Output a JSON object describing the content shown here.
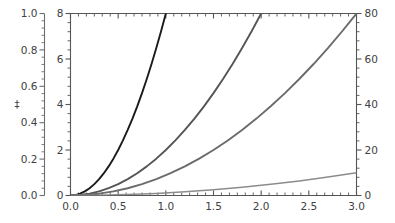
{
  "figure": {
    "background_color": "#ffffff",
    "axis_color": "#555555",
    "text_color": "#414141",
    "title": "",
    "faint_marker": "‡"
  },
  "chart_data": {
    "type": "line",
    "title": "",
    "xlabel": "",
    "ylabel": "",
    "grid": false,
    "legend": "none",
    "xlim": [
      0.0,
      3.0
    ],
    "x_ticks": [
      "0.0",
      "0.5",
      "1.0",
      "1.5",
      "2.0",
      "2.5",
      "3.0"
    ],
    "x_tick_values": [
      0.0,
      0.5,
      1.0,
      1.5,
      2.0,
      2.5,
      3.0
    ],
    "x_minor_per_interval": 5,
    "axes": [
      {
        "id": "outer-left",
        "position": "left-detached",
        "ylim": [
          0.0,
          1.0
        ],
        "ticks": [
          "0.0",
          "0.2",
          "0.4",
          "0.6",
          "0.8",
          "1.0"
        ],
        "tick_values": [
          0.0,
          0.2,
          0.4,
          0.6,
          0.8,
          1.0
        ],
        "minor_per_interval": 4,
        "color": "#6e6e6e"
      },
      {
        "id": "inner-left",
        "position": "left",
        "ylim": [
          0,
          8
        ],
        "ticks": [
          "0",
          "2",
          "4",
          "6",
          "8"
        ],
        "tick_values": [
          0,
          2,
          4,
          6,
          8
        ],
        "minor_per_interval": 4,
        "color": "#555555"
      },
      {
        "id": "right",
        "position": "right",
        "ylim": [
          0,
          80
        ],
        "ticks": [
          "0",
          "20",
          "40",
          "60",
          "80"
        ],
        "tick_values": [
          0,
          20,
          40,
          60,
          80
        ],
        "minor_per_interval": 4,
        "color": "#555555"
      }
    ],
    "series": [
      {
        "name": "curve-1",
        "color": "#1a1a1a",
        "width": 1.9,
        "axis": "inner-left",
        "x": [
          0.0,
          0.05,
          0.1,
          0.15,
          0.2,
          0.25,
          0.3,
          0.35,
          0.4,
          0.45,
          0.5,
          0.55,
          0.6,
          0.65,
          0.7,
          0.75,
          0.8,
          0.85,
          0.9,
          0.95,
          1.0
        ],
        "y": [
          0.0,
          0.02,
          0.08,
          0.18,
          0.32,
          0.5,
          0.72,
          0.98,
          1.28,
          1.62,
          2.0,
          2.42,
          2.88,
          3.38,
          3.92,
          4.5,
          5.12,
          5.78,
          6.48,
          7.22,
          8.0
        ]
      },
      {
        "name": "curve-2",
        "color": "#555555",
        "width": 1.9,
        "axis": "inner-left",
        "x": [
          0.0,
          0.1,
          0.2,
          0.3,
          0.4,
          0.5,
          0.6,
          0.7,
          0.8,
          0.9,
          1.0,
          1.1,
          1.2,
          1.3,
          1.4,
          1.5,
          1.6,
          1.7,
          1.8,
          1.9,
          2.0
        ],
        "y": [
          0.0,
          0.02,
          0.08,
          0.18,
          0.32,
          0.5,
          0.72,
          0.98,
          1.28,
          1.62,
          2.0,
          2.42,
          2.88,
          3.38,
          3.92,
          4.5,
          5.12,
          5.78,
          6.48,
          7.22,
          8.0
        ]
      },
      {
        "name": "curve-3",
        "color": "#6b6b6b",
        "width": 1.9,
        "axis": "right",
        "x": [
          0.0,
          0.15,
          0.3,
          0.45,
          0.6,
          0.75,
          0.9,
          1.05,
          1.2,
          1.35,
          1.5,
          1.65,
          1.8,
          1.95,
          2.1,
          2.25,
          2.4,
          2.55,
          2.7,
          2.85,
          3.0
        ],
        "y": [
          0.0,
          0.2,
          0.8,
          1.8,
          3.2,
          5.0,
          7.2,
          9.8,
          12.8,
          16.2,
          20.0,
          24.2,
          28.8,
          33.8,
          39.2,
          45.0,
          51.2,
          57.8,
          64.8,
          72.2,
          80.0
        ]
      },
      {
        "name": "curve-4-flat",
        "color": "#8c8c8c",
        "width": 1.5,
        "axis": "inner-left",
        "x": [
          0.0,
          0.3,
          0.6,
          0.9,
          1.2,
          1.5,
          1.8,
          2.1,
          2.4,
          2.7,
          3.0
        ],
        "y": [
          0.0,
          0.01,
          0.04,
          0.09,
          0.16,
          0.25,
          0.36,
          0.49,
          0.64,
          0.81,
          1.0
        ]
      }
    ]
  }
}
